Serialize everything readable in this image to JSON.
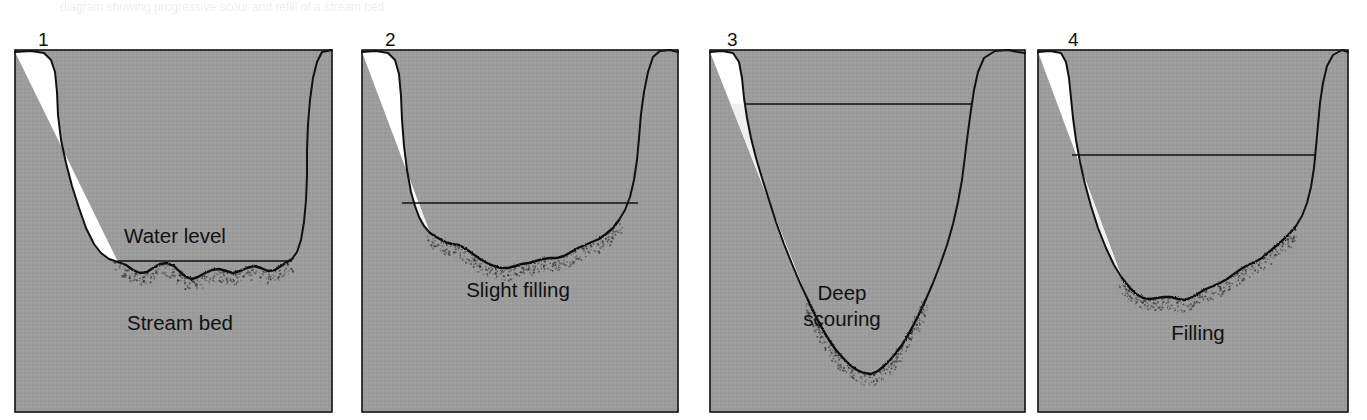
{
  "figure": {
    "background_color": "#ffffff",
    "ground_color": "#9c9c9c",
    "ground_color_dark": "#8f8f8f",
    "water_color": "#efefef",
    "outline_color": "#111111",
    "text_color": "#111111",
    "panel_count": 4
  },
  "panels": [
    {
      "number": "1",
      "number_x": 38,
      "number_y": 30,
      "box": {
        "x": 15,
        "y": 50,
        "width": 317,
        "height": 362
      },
      "water_level_y": 261,
      "water_level_label": "Water level",
      "water_level_label_x": 175,
      "water_level_label_y": 243,
      "bed_label": "Stream bed",
      "bed_label_x": 180,
      "bed_label_y": 330,
      "state": "normal flow, shallow water over natural stream bed",
      "left_bank_path": "M15,52 L31,51 L44,53 L51,60 L55,72 L57,92 L58,115 L61,140 L66,163 L72,186 L79,208 L86,228 L94,244 L101,253 L109,259 L118,262",
      "bed_path": "M118,262 L126,265 L133,270 L140,273 L147,272 L153,268 L160,264 L167,263 L174,266 L180,272 L186,277 L192,279 L198,277 L205,273 L212,270 L219,269 L226,271 L233,273 L240,271 L247,268 L254,266 L261,268 L268,271 L275,270 L281,266 L287,262 L292,259",
      "right_bank_path": "M292,259 L297,252 L301,240 L304,222 L306,200 L307,176 L307,150 L308,124 L310,100 L313,78 L317,62 L322,52 L332,50",
      "water_top_left_x": 118,
      "water_top_right_x": 292
    },
    {
      "number": "2",
      "number_x": 385,
      "number_y": 30,
      "box": {
        "x": 362,
        "y": 50,
        "width": 316,
        "height": 362
      },
      "water_level_y": 203,
      "water_level_label": null,
      "bed_label": "Slight filling",
      "bed_label_x": 518,
      "bed_label_y": 297,
      "state": "slight filling of the scour hole with sediment",
      "left_bank_path": "M362,52 L376,51 L388,53 L395,60 L399,74 L401,96 L402,120 L404,146 L407,170 L411,192 L415,206 L419,217 L424,226 L430,233",
      "bed_path": "M430,233 L438,238 L445,242 L452,244 L459,245 L466,249 L473,254 L480,259 L487,263 L494,266 L501,268 L508,268 L515,266 L522,264 L529,263 L536,261 L543,259 L550,258 L557,258 L564,256 L571,252 L578,248 L585,245 L592,242 L599,239 L606,234 L613,228 L619,220",
      "right_bank_path": "M619,220 L625,210 L630,197 L634,180 L637,160 L639,138 L641,114 L644,92 L648,72 L653,57 L660,51 L670,50 L678,52",
      "water_top_left_x": 402,
      "water_top_right_x": 638
    },
    {
      "number": "3",
      "number_x": 727,
      "number_y": 30,
      "box": {
        "x": 710,
        "y": 50,
        "width": 315,
        "height": 362
      },
      "water_level_y": 104,
      "water_level_label": null,
      "bed_label": "Deep\nscouring",
      "bed_label_line1": "Deep",
      "bed_label_line2": "scouring",
      "bed_label_x": 842,
      "bed_label_y": 300,
      "state": "deep scouring removes bed material during flood",
      "left_bank_path": "M710,52 L722,51 L733,53 L739,62 L742,78 L744,98 L747,118 L751,138 L756,158 L762,178 L769,200 L776,222 L784,244 L792,264 L800,283 L808,300",
      "bed_path": "M808,300 L815,315 L822,328 L829,340 L836,350 L843,358 L850,365 L857,370 L864,373 L871,374 L878,371 L884,366 L890,360 L896,353 L902,345 L908,335 L914,324 L920,312 L926,299",
      "right_bank_path": "M926,299 L933,283 L940,265 L947,245 L953,224 L958,202 L962,180 L965,156 L968,132 L971,110 L974,90 L978,72 L984,58 L995,51 L1008,50 L1018,52 L1025,53",
      "water_top_left_x": 744,
      "water_top_right_x": 971
    },
    {
      "number": "4",
      "number_x": 1068,
      "number_y": 30,
      "box": {
        "x": 1038,
        "y": 50,
        "width": 310,
        "height": 362
      },
      "water_level_y": 155,
      "water_level_label": null,
      "bed_label": "Filling",
      "bed_label_x": 1198,
      "bed_label_y": 340,
      "state": "scour hole refilled with sediment after the flood",
      "left_bank_path": "M1038,52 L1050,51 L1061,53 L1066,62 L1069,78 L1071,98 L1073,118 L1076,140 L1080,162 L1085,184 L1091,206 L1098,228 L1106,248 L1114,265 L1122,278",
      "bed_path": "M1122,278 L1130,288 L1136,294 L1143,298 L1150,299 L1157,298 L1164,297 L1171,297 L1178,299 L1185,300 L1192,297 L1199,293 L1206,289 L1213,286 L1220,283 L1227,279 L1234,274 L1241,269 L1248,265 L1255,262 L1262,258 L1269,252 L1276,246 L1283,240 L1290,233 L1296,226",
      "right_bank_path": "M1296,226 L1302,216 L1307,203 L1311,187 L1314,168 L1316,147 L1318,125 L1320,103 L1323,83 L1327,66 L1333,55 L1342,50 L1348,52",
      "water_top_left_x": 1072,
      "water_top_right_x": 1315
    }
  ],
  "ghost_header": "diagram showing progressive scour and refill of a stream bed"
}
